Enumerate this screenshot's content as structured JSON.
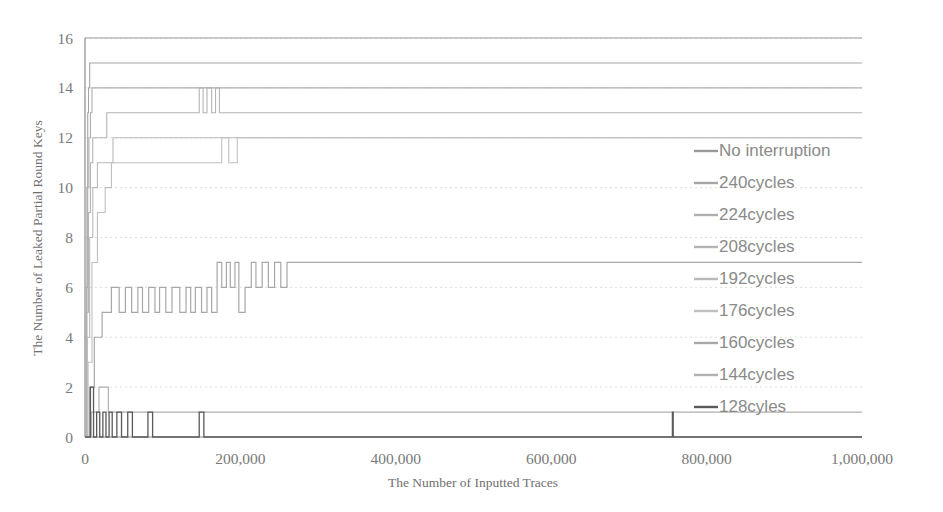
{
  "chart_data": {
    "type": "line",
    "title": "",
    "xlabel": "The Number of Inputted Traces",
    "ylabel": "The Number of Leaked Partial Round Keys",
    "xlim": [
      0,
      1000000
    ],
    "ylim": [
      0,
      16
    ],
    "xticks": [
      0,
      200000,
      400000,
      600000,
      800000,
      1000000
    ],
    "xticklabels": [
      "0",
      "200,000",
      "400,000",
      "600,000",
      "800,000",
      "1,000,000"
    ],
    "yticks": [
      0,
      2,
      4,
      6,
      8,
      10,
      12,
      14,
      16
    ],
    "yticklabels": [
      "0",
      "2",
      "4",
      "6",
      "8",
      "10",
      "12",
      "14",
      "16"
    ],
    "grid": "horizontal-dotted",
    "legend_position": "center-right-inside",
    "series": [
      {
        "name": "No interruption",
        "color": "#9a9a9a",
        "width": 1.1,
        "points": [
          [
            0,
            16
          ],
          [
            1000000,
            16
          ]
        ]
      },
      {
        "name": "240cycles",
        "color": "#a5a5a5",
        "width": 1.1,
        "points": [
          [
            0,
            0
          ],
          [
            1500,
            5
          ],
          [
            2500,
            10
          ],
          [
            3500,
            13
          ],
          [
            4500,
            14
          ],
          [
            6000,
            15
          ],
          [
            1000000,
            15
          ]
        ]
      },
      {
        "name": "224cycles",
        "color": "#aeaeae",
        "width": 1.1,
        "points": [
          [
            0,
            0
          ],
          [
            2000,
            6
          ],
          [
            3500,
            10
          ],
          [
            5000,
            12
          ],
          [
            7000,
            13
          ],
          [
            9000,
            14
          ],
          [
            1000000,
            14
          ]
        ]
      },
      {
        "name": "208cycles",
        "color": "#b4b4b4",
        "width": 1.1,
        "points": [
          [
            0,
            0
          ],
          [
            2500,
            5
          ],
          [
            4500,
            9
          ],
          [
            7000,
            11
          ],
          [
            10000,
            12
          ],
          [
            22000,
            12
          ],
          [
            28000,
            13
          ],
          [
            140000,
            13
          ],
          [
            147000,
            14
          ],
          [
            152000,
            13
          ],
          [
            157000,
            14
          ],
          [
            163000,
            13
          ],
          [
            168000,
            14
          ],
          [
            173000,
            13
          ],
          [
            1000000,
            13
          ]
        ]
      },
      {
        "name": "192cycles",
        "color": "#bababa",
        "width": 1.1,
        "points": [
          [
            0,
            0
          ],
          [
            3000,
            4
          ],
          [
            6000,
            8
          ],
          [
            10000,
            10
          ],
          [
            16000,
            11
          ],
          [
            30000,
            11
          ],
          [
            36000,
            12
          ],
          [
            1000000,
            12
          ]
        ]
      },
      {
        "name": "176cycles",
        "color": "#c0c0c0",
        "width": 1.1,
        "points": [
          [
            0,
            0
          ],
          [
            4000,
            3
          ],
          [
            9000,
            7
          ],
          [
            16000,
            9
          ],
          [
            26000,
            10
          ],
          [
            34000,
            11
          ],
          [
            168000,
            11
          ],
          [
            176000,
            12
          ],
          [
            185000,
            11
          ],
          [
            196000,
            12
          ],
          [
            1000000,
            12
          ]
        ]
      },
      {
        "name": "160cycles",
        "color": "#a8a8a8",
        "width": 1.2,
        "points": [
          [
            0,
            0
          ],
          [
            6000,
            2
          ],
          [
            12000,
            4
          ],
          [
            22000,
            5
          ],
          [
            34000,
            6
          ],
          [
            44000,
            5
          ],
          [
            52000,
            6
          ],
          [
            60000,
            5
          ],
          [
            68000,
            6
          ],
          [
            74000,
            5
          ],
          [
            82000,
            6
          ],
          [
            90000,
            5
          ],
          [
            96000,
            6
          ],
          [
            104000,
            5
          ],
          [
            112000,
            6
          ],
          [
            122000,
            5
          ],
          [
            130000,
            6
          ],
          [
            136000,
            5
          ],
          [
            142000,
            6
          ],
          [
            150000,
            5
          ],
          [
            157000,
            6
          ],
          [
            163000,
            5
          ],
          [
            170000,
            7
          ],
          [
            176000,
            6
          ],
          [
            182000,
            7
          ],
          [
            187000,
            6
          ],
          [
            193000,
            7
          ],
          [
            198000,
            5
          ],
          [
            206000,
            6
          ],
          [
            214000,
            7
          ],
          [
            220000,
            6
          ],
          [
            228000,
            7
          ],
          [
            236000,
            6
          ],
          [
            244000,
            7
          ],
          [
            252000,
            6
          ],
          [
            260000,
            7
          ],
          [
            1000000,
            7
          ]
        ]
      },
      {
        "name": "144cycles",
        "color": "#b0b0b0",
        "width": 1.2,
        "points": [
          [
            0,
            0
          ],
          [
            8000,
            1
          ],
          [
            18000,
            2
          ],
          [
            30000,
            1
          ],
          [
            1000000,
            1
          ]
        ]
      },
      {
        "name": "128cyles",
        "color": "#5a5a5a",
        "width": 1.3,
        "points": [
          [
            0,
            0
          ],
          [
            6000,
            0
          ],
          [
            7000,
            2
          ],
          [
            10000,
            2
          ],
          [
            11000,
            0
          ],
          [
            14000,
            0
          ],
          [
            15000,
            1
          ],
          [
            18000,
            1
          ],
          [
            19000,
            0
          ],
          [
            22000,
            0
          ],
          [
            23000,
            1
          ],
          [
            26000,
            1
          ],
          [
            27000,
            0
          ],
          [
            30000,
            0
          ],
          [
            31000,
            1
          ],
          [
            34000,
            1
          ],
          [
            35000,
            0
          ],
          [
            40000,
            0
          ],
          [
            41000,
            1
          ],
          [
            46000,
            1
          ],
          [
            47000,
            0
          ],
          [
            54000,
            0
          ],
          [
            55000,
            1
          ],
          [
            60000,
            1
          ],
          [
            61000,
            0
          ],
          [
            80000,
            0
          ],
          [
            81000,
            1
          ],
          [
            86000,
            1
          ],
          [
            87000,
            0
          ],
          [
            146000,
            0
          ],
          [
            147000,
            1
          ],
          [
            152000,
            1
          ],
          [
            153000,
            0
          ],
          [
            755000,
            0
          ],
          [
            756000,
            1
          ],
          [
            757000,
            0
          ],
          [
            1000000,
            0
          ]
        ]
      }
    ],
    "legend_entries": [
      "No interruption",
      "240cycles",
      "224cycles",
      "208cycles",
      "192cycles",
      "176cycles",
      "160cycles",
      "144cycles",
      "128cyles"
    ]
  },
  "geometry": {
    "plot_left": 85,
    "plot_right": 862,
    "plot_top": 38,
    "plot_bottom": 437,
    "legend_x": 690,
    "legend_swatch_x0": 694,
    "legend_swatch_x1": 718,
    "legend_text_x": 719,
    "legend_y_start": 156,
    "legend_y_step": 32
  }
}
